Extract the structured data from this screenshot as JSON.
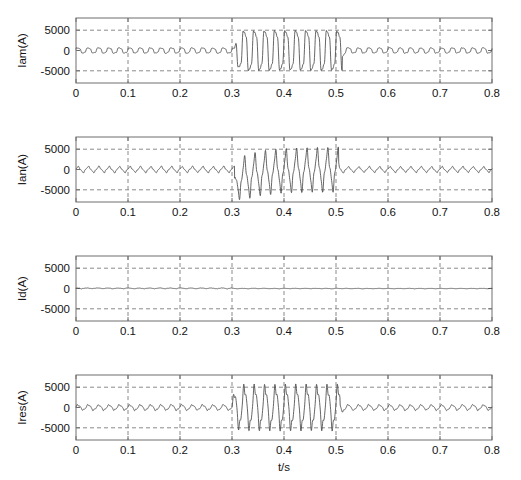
{
  "figure": {
    "width": 521,
    "height": 480,
    "background": "#ffffff",
    "line_color": "#4a4a4a",
    "grid_color": "#8a8a8a",
    "axis_color": "#6e6e6e"
  },
  "chart_data": [
    {
      "type": "line",
      "title": "",
      "xlabel": "",
      "ylabel": "Iam(A)",
      "xlim": [
        0,
        0.8
      ],
      "ylim": [
        -8000,
        8000
      ],
      "xticks": [
        0,
        0.1,
        0.2,
        0.3,
        0.4,
        0.5,
        0.6,
        0.7,
        0.8
      ],
      "xticklabels": [
        "0",
        "0.1",
        "0.2",
        "0.3",
        "0.4",
        "0.5",
        "0.6",
        "0.7",
        "0.8"
      ],
      "yticks": [
        -5000,
        0,
        5000
      ],
      "yticklabels": [
        "-5000",
        "0",
        "5000"
      ],
      "grid": true,
      "grid_style": "dashed",
      "legend": "none",
      "waveform": {
        "model": "sinusoid_with_fault_burst",
        "base_frequency_hz": 50,
        "prefault_amplitude": 700,
        "prefault_mean": 0,
        "fault_start_s": 0.305,
        "fault_end_s": 0.512,
        "fault_amplitude": 5200,
        "fault_dc_offset": 0,
        "fault_dc_decay_s": 0.05,
        "postfault_amplitude": 700,
        "noise_amplitude": 160
      }
    },
    {
      "type": "line",
      "title": "",
      "xlabel": "",
      "ylabel": "Ian(A)",
      "xlim": [
        0,
        0.8
      ],
      "ylim": [
        -8000,
        8000
      ],
      "xticks": [
        0,
        0.1,
        0.2,
        0.3,
        0.4,
        0.5,
        0.6,
        0.7,
        0.8
      ],
      "xticklabels": [
        "0",
        "0.1",
        "0.2",
        "0.3",
        "0.4",
        "0.5",
        "0.6",
        "0.7",
        "0.8"
      ],
      "yticks": [
        -5000,
        0,
        5000
      ],
      "yticklabels": [
        "-5000",
        "0",
        "5000"
      ],
      "grid": true,
      "grid_style": "dashed",
      "legend": "none",
      "waveform": {
        "model": "sinusoid_with_fault_burst",
        "base_frequency_hz": 50,
        "prefault_amplitude": 650,
        "prefault_mean": 0,
        "fault_start_s": 0.305,
        "fault_end_s": 0.505,
        "fault_amplitude": 4300,
        "fault_dc_offset": -3000,
        "fault_dc_decay_s": 0.045,
        "postfault_amplitude": 600,
        "noise_amplitude": 150
      }
    },
    {
      "type": "line",
      "title": "",
      "xlabel": "",
      "ylabel": "Id(A)",
      "xlim": [
        0,
        0.8
      ],
      "ylim": [
        -8000,
        8000
      ],
      "xticks": [
        0,
        0.1,
        0.2,
        0.3,
        0.4,
        0.5,
        0.6,
        0.7,
        0.8
      ],
      "xticklabels": [
        "0",
        "0.1",
        "0.2",
        "0.3",
        "0.4",
        "0.5",
        "0.6",
        "0.7",
        "0.8"
      ],
      "yticks": [
        -5000,
        0,
        5000
      ],
      "yticklabels": [
        "-5000",
        "0",
        "5000"
      ],
      "grid": true,
      "grid_style": "dashed",
      "legend": "none",
      "waveform": {
        "model": "low_ripple_flat",
        "base_frequency_hz": 50,
        "prefault_amplitude": 300,
        "prefault_mean": 0,
        "fault_start_s": 0.305,
        "fault_end_s": 0.512,
        "fault_amplitude": 180,
        "fault_dc_offset": 0,
        "fault_dc_decay_s": 0.05,
        "postfault_amplitude": 170,
        "noise_amplitude": 70
      }
    },
    {
      "type": "line",
      "title": "",
      "xlabel": "t/s",
      "ylabel": "Ires(A)",
      "xlim": [
        0,
        0.8
      ],
      "ylim": [
        -8000,
        8000
      ],
      "xticks": [
        0,
        0.1,
        0.2,
        0.3,
        0.4,
        0.5,
        0.6,
        0.7,
        0.8
      ],
      "xticklabels": [
        "0",
        "0.1",
        "0.2",
        "0.3",
        "0.4",
        "0.5",
        "0.6",
        "0.7",
        "0.8"
      ],
      "yticks": [
        -5000,
        0,
        5000
      ],
      "yticklabels": [
        "-5000",
        "0",
        "5000"
      ],
      "grid": true,
      "grid_style": "dashed",
      "legend": "none",
      "waveform": {
        "model": "sinusoid_with_fault_burst",
        "base_frequency_hz": 50,
        "prefault_amplitude": 620,
        "prefault_mean": 0,
        "fault_start_s": 0.3,
        "fault_end_s": 0.508,
        "fault_amplitude": 4800,
        "fault_dc_offset": 0,
        "fault_dc_decay_s": 0.05,
        "postfault_amplitude": 620,
        "noise_amplitude": 150
      }
    }
  ]
}
